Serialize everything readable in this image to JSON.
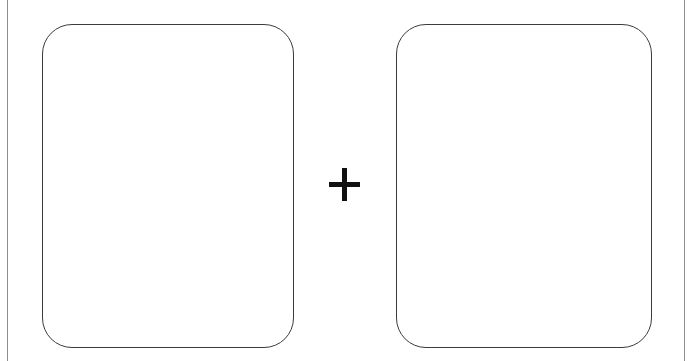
{
  "canvas": {
    "width": 700,
    "height": 361,
    "background_color": "#ffffff"
  },
  "frame": {
    "name": "outer-frame",
    "style": "two vertical rules, no top or bottom rule",
    "line_color": "#8d8d8d",
    "left_rule_x": 7,
    "right_rule_x": 684,
    "line_width_px": 1
  },
  "panels": [
    {
      "id": "left-panel",
      "label": "",
      "content": "",
      "x": 42,
      "y": 24,
      "width": 252,
      "height": 324,
      "corner_radius": 30,
      "border_color": "#3b3b3b",
      "border_width_px": 1.4,
      "fill_color": "#ffffff"
    },
    {
      "id": "right-panel",
      "label": "",
      "content": "",
      "x": 396,
      "y": 24,
      "width": 256,
      "height": 324,
      "corner_radius": 30,
      "border_color": "#3b3b3b",
      "border_width_px": 1.4,
      "fill_color": "#ffffff"
    }
  ],
  "operator": {
    "symbol": "+",
    "name": "plus-operator",
    "color": "#111111",
    "center_x": 344,
    "center_y": 184,
    "width": 31,
    "height": 33,
    "stroke_width": 5
  }
}
